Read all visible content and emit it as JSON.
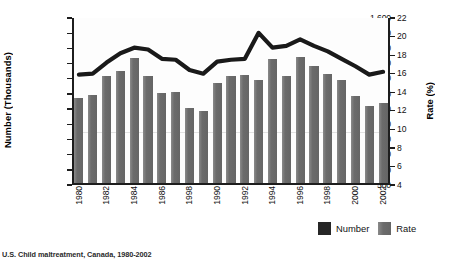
{
  "chart_data": {
    "type": "bar",
    "title": "",
    "xlabel": "",
    "ylabel": "Number (Thousands)",
    "y2label": "Rate (%)",
    "ylim": [
      500,
      1600
    ],
    "y2lim": [
      4,
      22
    ],
    "grid": true,
    "legend_position": "bottom-right",
    "x": [
      1980,
      1981,
      1982,
      1983,
      1984,
      1985,
      1986,
      1987,
      1988,
      1989,
      1990,
      1991,
      1992,
      1993,
      1994,
      1995,
      1996,
      1997,
      1998,
      1999,
      2000,
      2001,
      2002
    ],
    "categories": [
      "1980",
      "1981",
      "1982",
      "1983",
      "1984",
      "1985",
      "1986",
      "1987",
      "1988",
      "1989",
      "1990",
      "1991",
      "1992",
      "1993",
      "1994",
      "1995",
      "1996",
      "1997",
      "1998",
      "1999",
      "2000",
      "2001",
      "2002"
    ],
    "xtick_labels": [
      "1980",
      "1982",
      "1984",
      "1998",
      "1990",
      "1992",
      "1994",
      "1996",
      "1998",
      "2000",
      "2002"
    ],
    "xtick_labels_shown": [
      "1980",
      "1982",
      "1984",
      "1986",
      "1998",
      "1990",
      "1992",
      "1994",
      "1996",
      "1998",
      "2000",
      "2002"
    ],
    "ytick_labels": [
      "1,600",
      "1,500",
      "1,400",
      "1,300",
      "1,200",
      "1,100",
      "1,000",
      "900",
      "800",
      "700",
      "600",
      "500"
    ],
    "y2tick_labels": [
      "22",
      "20",
      "18",
      "16",
      "14",
      "12",
      "10",
      "8",
      "6",
      "4"
    ],
    "series": [
      {
        "name": "Rate",
        "kind": "bar",
        "axis": "left",
        "color": "#6b6b6b",
        "values": [
          1070,
          1090,
          1220,
          1250,
          1335,
          1215,
          1105,
          1115,
          1005,
          990,
          1175,
          1215,
          1225,
          1190,
          1330,
          1215,
          1345,
          1285,
          1230,
          1190,
          1085,
          1020,
          1040
        ]
      },
      {
        "name": "Number",
        "kind": "line",
        "axis": "right",
        "color": "#1a1a1a",
        "values": [
          15.9,
          16.0,
          17.2,
          18.2,
          18.8,
          18.6,
          17.6,
          17.5,
          16.4,
          16.0,
          17.3,
          17.5,
          17.6,
          20.4,
          18.8,
          19.0,
          19.7,
          19.0,
          18.4,
          17.6,
          16.8,
          15.9,
          16.2
        ]
      }
    ],
    "legend": [
      {
        "label": "Number",
        "color": "#262626"
      },
      {
        "label": "Rate",
        "color": "#6b6b6b"
      }
    ]
  },
  "caption": "U.S. Child maltreatment, Canada, 1980-2002"
}
